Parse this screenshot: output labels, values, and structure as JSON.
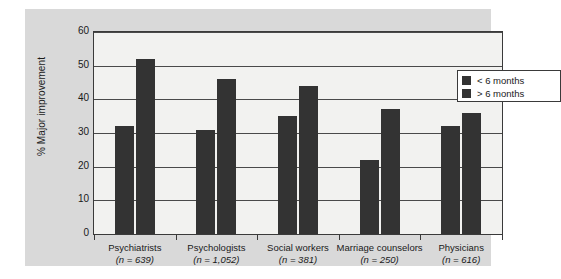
{
  "chart_data": {
    "type": "bar",
    "title": "",
    "xlabel": "",
    "ylabel": "% Major improvement",
    "ylim": [
      0,
      60
    ],
    "yticks": [
      0,
      10,
      20,
      30,
      40,
      50,
      60
    ],
    "grid": true,
    "legend_position": "top-right",
    "categories": [
      "Psychiatrists",
      "Psychologists",
      "Social workers",
      "Marriage counselors",
      "Physicians"
    ],
    "category_sublabels": [
      "(n = 639)",
      "(n = 1,052)",
      "(n = 381)",
      "(n = 250)",
      "(n = 616)"
    ],
    "series": [
      {
        "name": "< 6 months",
        "color": "#333333",
        "values": [
          32,
          31,
          35,
          22,
          32
        ]
      },
      {
        "name": "> 6 months",
        "color": "#333333",
        "values": [
          52,
          46,
          44,
          37,
          36
        ]
      }
    ]
  },
  "legend": {
    "items": [
      {
        "label": "< 6 months"
      },
      {
        "label": "> 6 months"
      }
    ]
  },
  "axis": {
    "y_labels": [
      "60",
      "50",
      "40",
      "30",
      "20",
      "10",
      "0"
    ],
    "y_title": "% Major improvement"
  },
  "colors": {
    "bar": "#333333",
    "panel": "#d9d9d9",
    "plot_background": "#f2f2f0",
    "axis": "#3a3a3a",
    "grid": "#4a4a4a"
  }
}
